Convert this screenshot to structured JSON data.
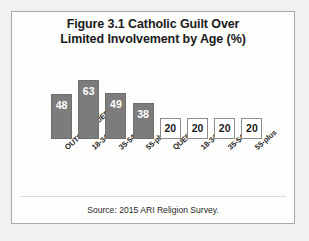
{
  "chart_data": {
    "type": "bar",
    "title": "Figure 3.1 Catholic Guilt Over Limited Involvement by Age (%)",
    "title_lines": [
      "Figure 3.1 Catholic Guilt Over",
      "Limited Involvement by Age (%)"
    ],
    "xlabel": "",
    "ylabel": "",
    "ylim": [
      0,
      70
    ],
    "grid": false,
    "legend": "none",
    "source": "Source:  2015 ARI Religion Survey.",
    "categories": [
      "OUTSIDE QUEBEC",
      "18-34",
      "35-54",
      "55-plus",
      "QUEBEC",
      "18-34",
      "35-54",
      "55-plus"
    ],
    "values": [
      48,
      63,
      49,
      38,
      20,
      20,
      20,
      20
    ],
    "bars": [
      {
        "label": "OUTSIDE QUEBEC",
        "value": 48,
        "style": "filled"
      },
      {
        "label": "18-34",
        "value": 63,
        "style": "filled"
      },
      {
        "label": "35-54",
        "value": 49,
        "style": "filled"
      },
      {
        "label": "55-plus",
        "value": 38,
        "style": "filled"
      },
      {
        "label": "QUEBEC",
        "value": 20,
        "style": "outline"
      },
      {
        "label": "18-34",
        "value": 20,
        "style": "outline"
      },
      {
        "label": "35-54",
        "value": 20,
        "style": "outline"
      },
      {
        "label": "55-plus",
        "value": 20,
        "style": "outline"
      }
    ],
    "colors": {
      "bar_fill": "#7c7c7c",
      "bar_stroke": "#6e6e6e",
      "box_fill": "#ffffff",
      "box_stroke": "#8d8d8d",
      "bar_label": "#ffffff",
      "box_label": "#1b1b1b",
      "frame": "#a9a9a9",
      "background": "#fdfdfc",
      "page": "#f2f1ef",
      "text": "#1b1b1b"
    }
  }
}
